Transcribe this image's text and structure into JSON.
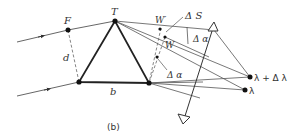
{
  "figure": {
    "caption": "(b)",
    "labels": {
      "F": "F",
      "T": "T",
      "W_prime": "W′",
      "W": "W",
      "delta_S": "Δ S",
      "d": "d",
      "b": "b",
      "delta_alpha_top": "Δ α",
      "delta_alpha_side": "Δ α",
      "lambda_plus": "λ + Δ λ",
      "lambda": "λ"
    },
    "colors": {
      "line": "#555555",
      "bold": "#222222",
      "text": "#333333"
    }
  }
}
